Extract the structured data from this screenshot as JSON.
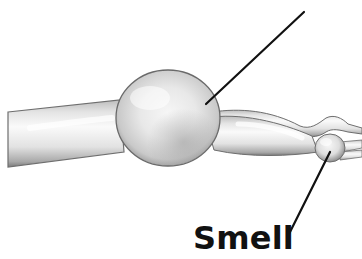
{
  "diagram": {
    "labels": [
      {
        "id": "smell",
        "text": "Smell",
        "points_to": "olfactory-bulb"
      },
      {
        "id": "top-pointer",
        "text": "",
        "points_to": "bulb-sphere"
      }
    ],
    "colors": {
      "background": "#ffffff",
      "structure_fill": "#e6e6e6",
      "structure_shadow": "#8a8a8a",
      "structure_highlight": "#fbfbfb",
      "outline": "#6e6e6e",
      "pointer_line": "#111111",
      "label_text": "#111111"
    }
  }
}
